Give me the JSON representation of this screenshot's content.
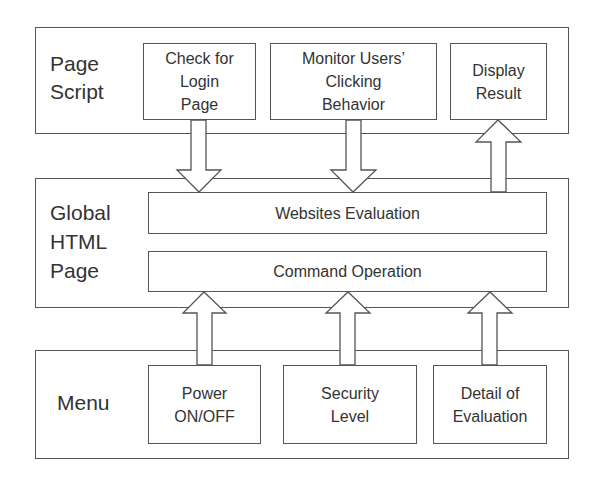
{
  "layers": {
    "page_script": {
      "label": "Page\nScript",
      "components": [
        {
          "label": "Check for\nLogin\nPage"
        },
        {
          "label": "Monitor Users’\nClicking\nBehavior"
        },
        {
          "label": "Display\nResult"
        }
      ]
    },
    "global_html_page": {
      "label": "Global\nHTML\nPage",
      "components": [
        {
          "label": "Websites Evaluation"
        },
        {
          "label": "Command Operation"
        }
      ]
    },
    "menu": {
      "label": "Menu",
      "components": [
        {
          "label": "Power\nON/OFF"
        },
        {
          "label": "Security\nLevel"
        },
        {
          "label": "Detail of\nEvaluation"
        }
      ]
    }
  },
  "arrows": [
    {
      "from": "Check for Login Page",
      "to": "Websites Evaluation",
      "direction": "down"
    },
    {
      "from": "Monitor Users’ Clicking Behavior",
      "to": "Websites Evaluation",
      "direction": "down"
    },
    {
      "from": "Websites Evaluation",
      "to": "Display Result",
      "direction": "up"
    },
    {
      "from": "Power ON/OFF",
      "to": "Command Operation",
      "direction": "up"
    },
    {
      "from": "Security Level",
      "to": "Command Operation",
      "direction": "up"
    },
    {
      "from": "Detail of Evaluation",
      "to": "Command Operation",
      "direction": "up"
    }
  ],
  "colors": {
    "stroke": "#555555",
    "text": "#333333",
    "background": "#ffffff"
  }
}
